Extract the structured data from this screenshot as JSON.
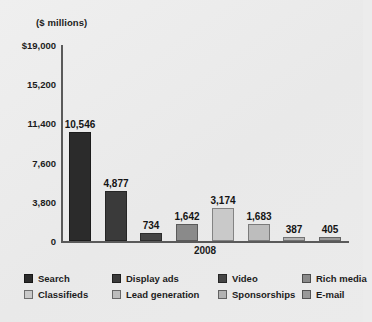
{
  "chart_data": {
    "type": "bar",
    "title": "($ millions)",
    "xlabel": "2008",
    "ylabel": "",
    "categories": [
      "Search",
      "Display ads",
      "Video",
      "Rich media",
      "Classifieds",
      "Lead generation",
      "Sponsorships",
      "E-mail"
    ],
    "values": [
      10546,
      4877,
      734,
      1642,
      3174,
      1683,
      387,
      405
    ],
    "value_labels": [
      "10,546",
      "4,877",
      "734",
      "1,642",
      "3,174",
      "1,683",
      "387",
      "405"
    ],
    "colors": [
      "#2b2b2b",
      "#3a3a3a",
      "#454545",
      "#8a8a8a",
      "#c9c9c9",
      "#bdbdbd",
      "#b3b3b3",
      "#9a9a9a"
    ],
    "ylim": [
      0,
      19000
    ],
    "yticks": [
      0,
      3800,
      7600,
      11400,
      15200,
      19000
    ],
    "ytick_labels": [
      "0",
      "3,800",
      "7,600",
      "11,400",
      "15,200",
      "$19,000"
    ],
    "grid": false,
    "legend_position": "bottom",
    "legend": [
      {
        "label": "Search",
        "color": "#2b2b2b"
      },
      {
        "label": "Display ads",
        "color": "#3a3a3a"
      },
      {
        "label": "Video",
        "color": "#454545"
      },
      {
        "label": "Rich media",
        "color": "#8a8a8a"
      },
      {
        "label": "Classifieds",
        "color": "#c9c9c9"
      },
      {
        "label": "Lead generation",
        "color": "#bdbdbd"
      },
      {
        "label": "Sponsorships",
        "color": "#b3b3b3"
      },
      {
        "label": "E-mail",
        "color": "#9a9a9a"
      }
    ],
    "background_color": "#ebebeb",
    "axis_color": "#5a5a5a"
  }
}
